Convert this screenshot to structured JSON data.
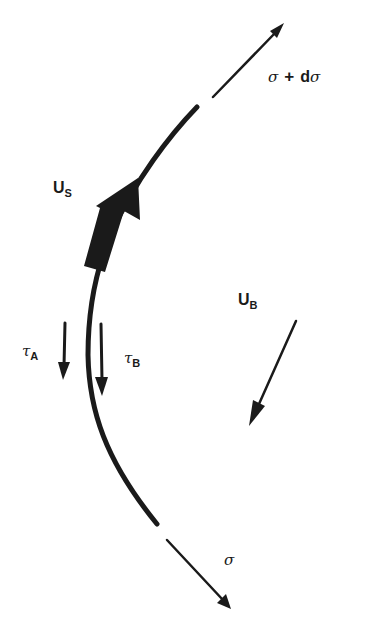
{
  "diagram": {
    "colors": {
      "ink": "#1a1a1a",
      "background": "#ffffff"
    },
    "labels": {
      "sigma_top": {
        "symbol": "σ",
        "plus": "+",
        "d": "d",
        "symbol2": "σ"
      },
      "sigma_bottom": {
        "symbol": "σ"
      },
      "u_s": {
        "main": "U",
        "sub": "S"
      },
      "u_b": {
        "main": "U",
        "sub": "B"
      },
      "tau_a": {
        "main": "τ",
        "sub": "A"
      },
      "tau_b": {
        "main": "τ",
        "sub": "B"
      }
    },
    "arrows": [
      {
        "name": "sigma-plus-dsigma-arrow",
        "from": [
          213,
          97
        ],
        "to": [
          283,
          25
        ]
      },
      {
        "name": "sigma-arrow",
        "from": [
          167,
          540
        ],
        "to": [
          230,
          608
        ]
      },
      {
        "name": "u-s-arrow",
        "from": [
          87,
          268
        ],
        "to": [
          138,
          178
        ]
      },
      {
        "name": "tau-a-arrow",
        "from": [
          65,
          322
        ],
        "to": [
          63,
          380
        ]
      },
      {
        "name": "tau-b-arrow",
        "from": [
          101,
          323
        ],
        "to": [
          102,
          395
        ]
      },
      {
        "name": "u-b-arrow",
        "from": [
          296,
          320
        ],
        "to": [
          250,
          425
        ]
      }
    ]
  }
}
